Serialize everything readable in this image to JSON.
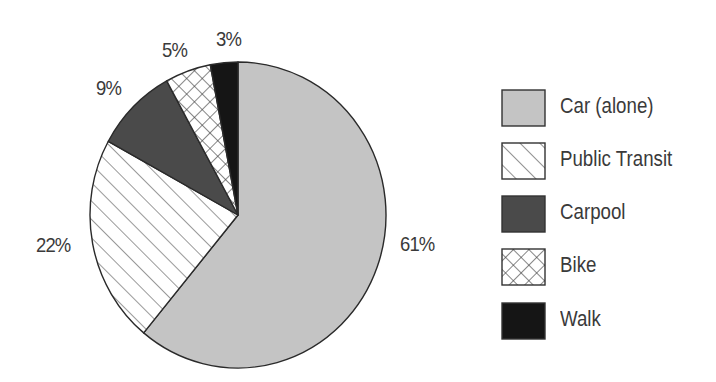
{
  "chart_data": {
    "type": "pie",
    "title": "",
    "categories": [
      "Car (alone)",
      "Public Transit",
      "Carpool",
      "Bike",
      "Walk"
    ],
    "values": [
      61,
      22,
      9,
      5,
      3
    ],
    "unit": "%",
    "start_angle_deg": 0,
    "direction": "clockwise",
    "legend_position": "right",
    "fills": [
      {
        "name": "Car (alone)",
        "pattern": "solid",
        "color": "#c4c4c4"
      },
      {
        "name": "Public Transit",
        "pattern": "diagonal-lines",
        "color": "#ffffff"
      },
      {
        "name": "Carpool",
        "pattern": "solid",
        "color": "#4a4a4a"
      },
      {
        "name": "Bike",
        "pattern": "crosshatch",
        "color": "#ffffff"
      },
      {
        "name": "Walk",
        "pattern": "solid",
        "color": "#151515"
      }
    ]
  },
  "labels": {
    "car": "61%",
    "transit": "22%",
    "carpool": "9%",
    "bike": "5%",
    "walk": "3%"
  },
  "legend": {
    "items": [
      {
        "label": "Car (alone)"
      },
      {
        "label": "Public Transit"
      },
      {
        "label": "Carpool"
      },
      {
        "label": "Bike"
      },
      {
        "label": "Walk"
      }
    ]
  }
}
